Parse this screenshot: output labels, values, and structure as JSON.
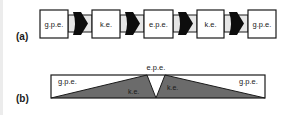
{
  "diagram": {
    "panel_a": {
      "label": "(a)",
      "boxes": [
        {
          "label": "g.p.e."
        },
        {
          "label": "k.e."
        },
        {
          "label": "e.p.e."
        },
        {
          "label": "k.e."
        },
        {
          "label": "g.p.e."
        }
      ],
      "connector_count": 4
    },
    "panel_b": {
      "label": "(b)",
      "top_label": "e.p.e.",
      "left_top_label": "g.p.e.",
      "left_bottom_label": "k.e.",
      "right_bottom_label": "k.e.",
      "right_top_label": "g.p.e."
    },
    "colors": {
      "stroke": "#1a1a1a",
      "arrow_fill": "#0d0d0d",
      "ke_fill": "#6b6b6b",
      "connector_fill": "#e6e6e6",
      "box_fill": "#ffffff"
    }
  }
}
